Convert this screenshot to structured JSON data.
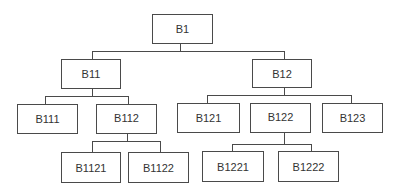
{
  "diagram": {
    "type": "tree",
    "root": {
      "label": "B1",
      "children": [
        {
          "label": "B11",
          "children": [
            {
              "label": "B111",
              "children": []
            },
            {
              "label": "B112",
              "children": [
                {
                  "label": "B1121",
                  "children": []
                },
                {
                  "label": "B1122",
                  "children": []
                }
              ]
            }
          ]
        },
        {
          "label": "B12",
          "children": [
            {
              "label": "B121",
              "children": []
            },
            {
              "label": "B122",
              "children": [
                {
                  "label": "B1221",
                  "children": []
                },
                {
                  "label": "B1222",
                  "children": []
                }
              ]
            },
            {
              "label": "B123",
              "children": []
            }
          ]
        }
      ]
    },
    "nodes": {
      "b1": "B1",
      "b11": "B11",
      "b12": "B12",
      "b111": "B111",
      "b112": "B112",
      "b1121": "B1121",
      "b1122": "B1122",
      "b121": "B121",
      "b122": "B122",
      "b123": "B123",
      "b1221": "B1221",
      "b1222": "B1222"
    }
  }
}
